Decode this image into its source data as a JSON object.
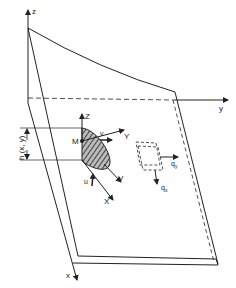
{
  "figure": {
    "type": "plate-coordinate-diagram",
    "global_axes": {
      "z": "z",
      "y": "y",
      "x": "x"
    },
    "local_axes": {
      "Z": "Z",
      "Y": "Y",
      "X": "X",
      "V": "V"
    },
    "point_label": "M",
    "displacements": {
      "u": "u",
      "v": "v"
    },
    "thickness_label": "h (x, y)",
    "shear_forces": {
      "qx": "q",
      "qx_sub": "x",
      "qy": "q",
      "qy_sub": "y"
    },
    "colors": {
      "line": "#222222",
      "hatch_fill": "#777777",
      "background": "#ffffff"
    }
  }
}
